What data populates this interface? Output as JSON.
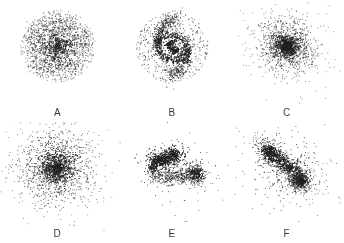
{
  "figure": {
    "background_color": "#ffffff",
    "point_color": "#202020",
    "layout": {
      "rows": 2,
      "cols": 3
    }
  },
  "panels": [
    {
      "id": "panel-a",
      "label": "A",
      "morphology": "multi-arm flocculent spiral galaxy",
      "center": [
        0.5,
        0.44
      ],
      "seed": 1207
    },
    {
      "id": "panel-b",
      "label": "B",
      "morphology": "two-arm grand-design barred spiral galaxy with inner ring",
      "center": [
        0.5,
        0.44
      ],
      "seed": 3311
    },
    {
      "id": "panel-c",
      "label": "C",
      "morphology": "compact elliptical / spheroidal galaxy",
      "center": [
        0.5,
        0.44
      ],
      "seed": 5021
    },
    {
      "id": "panel-d",
      "label": "D",
      "morphology": "diffuse elliptical galaxy with extended halo",
      "center": [
        0.48,
        0.44
      ],
      "seed": 7703
    },
    {
      "id": "panel-e",
      "label": "E",
      "morphology": "irregular interacting system with tidal bridge and secondary clump",
      "center": [
        0.46,
        0.44
      ],
      "seed": 9109
    },
    {
      "id": "panel-f",
      "label": "F",
      "morphology": "irregular merger with diagonal tidal streak and dense knot",
      "center": [
        0.5,
        0.45
      ],
      "seed": 4457
    }
  ],
  "chart_data": {
    "type": "scatter",
    "title": "",
    "xlabel": "",
    "ylabel": "",
    "grid": false,
    "legend": "none",
    "axes_visible": false,
    "subplot_labels": [
      "A",
      "B",
      "C",
      "D",
      "E",
      "F"
    ],
    "subplot_layout": {
      "rows": 2,
      "cols": 3
    },
    "marker": {
      "color": "#202020",
      "size_px": 1,
      "shape": "dot",
      "opacity_range": [
        0.35,
        1.0
      ]
    },
    "series": [
      {
        "name": "A",
        "description": "Multi-arm spiral: dense nucleus plus 5 logarithmic spiral arms winding counter-clockwise, surrounded by a scattered disk halo.",
        "n_points": 1750,
        "components": [
          {
            "type": "bulge",
            "n": 300,
            "sigma": 0.045,
            "center": [
              0.5,
              0.44
            ]
          },
          {
            "type": "spiral_arms",
            "n": 900,
            "arms": 5,
            "pitch_deg": 18,
            "turns": 1.15,
            "r_min": 0.05,
            "r_max": 0.3,
            "spread": 0.022,
            "center": [
              0.5,
              0.44
            ]
          },
          {
            "type": "disk_halo",
            "n": 550,
            "r_min": 0.04,
            "r_max": 0.36,
            "center": [
              0.5,
              0.44
            ]
          }
        ],
        "xlim": [
          0,
          1
        ],
        "ylim": [
          0,
          1
        ]
      },
      {
        "name": "B",
        "description": "Grand-design barred spiral: elongated bar nucleus, bright inner ring, and 2 sweeping outer arms with a faint outer halo.",
        "n_points": 1700,
        "components": [
          {
            "type": "bar",
            "n": 260,
            "length": 0.11,
            "width": 0.042,
            "angle_deg": 55,
            "center": [
              0.5,
              0.45
            ]
          },
          {
            "type": "ring",
            "n": 480,
            "radius": 0.145,
            "thickness": 0.026,
            "ellipticity": 0.8,
            "angle_deg": 20,
            "center": [
              0.5,
              0.45
            ]
          },
          {
            "type": "spiral_arms",
            "n": 560,
            "arms": 2,
            "pitch_deg": 24,
            "turns": 0.95,
            "r_min": 0.13,
            "r_max": 0.29,
            "spread": 0.026,
            "center": [
              0.5,
              0.45
            ]
          },
          {
            "type": "disk_halo",
            "n": 400,
            "r_min": 0.1,
            "r_max": 0.35,
            "center": [
              0.5,
              0.45
            ]
          }
        ],
        "xlim": [
          0,
          1
        ],
        "ylim": [
          0,
          1
        ]
      },
      {
        "name": "C",
        "description": "Compact elliptical: strongly concentrated core with a moderately extended smooth envelope, slightly elongated.",
        "n_points": 1650,
        "components": [
          {
            "type": "core",
            "n": 700,
            "sigma": 0.055,
            "ellipticity": 0.85,
            "angle_deg": 30,
            "center": [
              0.5,
              0.44
            ]
          },
          {
            "type": "envelope",
            "n": 950,
            "sigma": 0.135,
            "ellipticity": 0.88,
            "angle_deg": 30,
            "center": [
              0.5,
              0.44
            ]
          }
        ],
        "xlim": [
          0,
          1
        ],
        "ylim": [
          0,
          1
        ]
      },
      {
        "name": "D",
        "description": "Diffuse elliptical: softer core than C with a large, sparse, nearly round halo extending to the panel edges.",
        "n_points": 1800,
        "components": [
          {
            "type": "core",
            "n": 600,
            "sigma": 0.07,
            "ellipticity": 0.92,
            "angle_deg": 10,
            "center": [
              0.48,
              0.44
            ]
          },
          {
            "type": "envelope",
            "n": 1200,
            "sigma": 0.175,
            "ellipticity": 0.95,
            "angle_deg": 10,
            "center": [
              0.48,
              0.44
            ]
          }
        ],
        "xlim": [
          0,
          1
        ],
        "ylim": [
          0,
          1
        ]
      },
      {
        "name": "E",
        "description": "Irregular merger: clumpy elongated primary body in the upper-left, an arcing tidal bridge sweeping right and down to a secondary condensation at lower-right.",
        "n_points": 1700,
        "components": [
          {
            "type": "clumpy_body",
            "n": 800,
            "center": [
              0.42,
              0.36
            ],
            "length": 0.26,
            "width": 0.1,
            "angle_deg": -15,
            "clumps": 7
          },
          {
            "type": "tidal_arc",
            "n": 450,
            "start": [
              0.3,
              0.5
            ],
            "control": [
              0.55,
              0.58
            ],
            "end": [
              0.74,
              0.46
            ],
            "spread": 0.035
          },
          {
            "type": "secondary_clump",
            "n": 300,
            "center": [
              0.73,
              0.5
            ],
            "sigma": 0.055,
            "ellipticity": 0.7,
            "angle_deg": 70
          },
          {
            "type": "scatter_halo",
            "n": 150,
            "center": [
              0.5,
              0.45
            ],
            "sigma": 0.2
          }
        ],
        "xlim": [
          0,
          1
        ],
        "ylim": [
          0,
          1
        ]
      },
      {
        "name": "F",
        "description": "Irregular merger: bright diagonal tidal streak running from upper-left to lower-right, a dense knot at lower-right, and ragged filaments around the center.",
        "n_points": 1700,
        "components": [
          {
            "type": "diagonal_streak",
            "n": 700,
            "center": [
              0.48,
              0.42
            ],
            "length": 0.4,
            "width": 0.075,
            "angle_deg": 35,
            "clumps": 6
          },
          {
            "type": "dense_knot",
            "n": 430,
            "center": [
              0.63,
              0.57
            ],
            "sigma": 0.055,
            "ellipticity": 0.8,
            "angle_deg": -20
          },
          {
            "type": "upper_plume",
            "n": 300,
            "center": [
              0.33,
              0.28
            ],
            "sigma": 0.075,
            "ellipticity": 0.6,
            "angle_deg": 40
          },
          {
            "type": "scatter_halo",
            "n": 270,
            "center": [
              0.5,
              0.45
            ],
            "sigma": 0.19
          }
        ],
        "xlim": [
          0,
          1
        ],
        "ylim": [
          0,
          1
        ]
      }
    ]
  }
}
